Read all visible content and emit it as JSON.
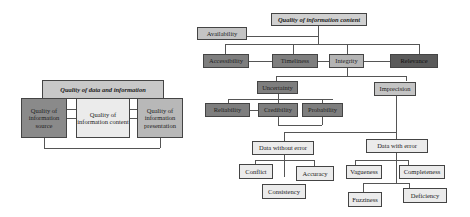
{
  "left_diagram": {
    "title": "Quality of data and information",
    "nodes": [
      {
        "label": "Quality of information source",
        "color": "#8a8a8a"
      },
      {
        "label": "Quality of information content",
        "color": "#ebebeb"
      },
      {
        "label": "Quality of information presentation",
        "color": "#b8b8b8"
      }
    ]
  },
  "right_diagram": {
    "title": "Quality of information content",
    "availability": "Availability",
    "level1": [
      "Accessibility",
      "Timeliness",
      "Integrity",
      "Relevance"
    ],
    "uncertainty": "Uncertainty",
    "imprecision": "Imprecision",
    "uncertainty_children": [
      "Reliability",
      "Credibility",
      "Probability"
    ],
    "data_without_error": "Data without error",
    "data_with_error": "Data with error",
    "without_error_children": [
      "Conflict",
      "Accuracy",
      "Consistency"
    ],
    "with_error_children": [
      "Vagueness",
      "Completeness",
      "Fuzziness",
      "Deficiency"
    ]
  }
}
